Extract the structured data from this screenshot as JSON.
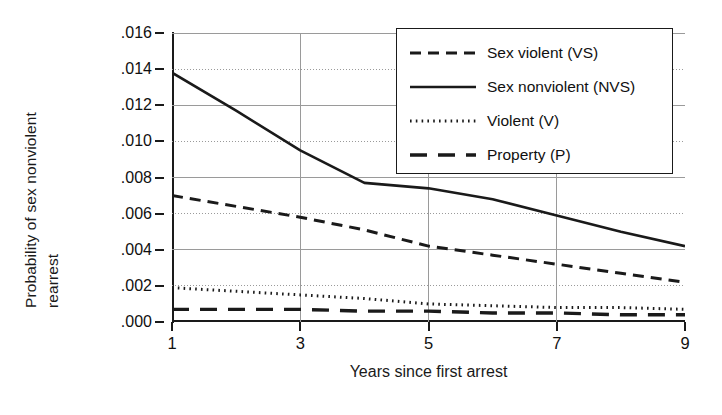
{
  "chart_data": {
    "type": "line",
    "title": "",
    "xlabel": "Years since first arrest",
    "ylabel": "Probability of sex nonviolent rearrest",
    "ylabel_lines": [
      "Probability of sex nonviolent",
      "rearrest"
    ],
    "xlim": [
      1,
      9
    ],
    "ylim": [
      0.0,
      0.016
    ],
    "xticks": [
      1,
      3,
      5,
      7,
      9
    ],
    "xtick_labels": [
      "1",
      "3",
      "5",
      "7",
      "9"
    ],
    "yticks": [
      0.0,
      0.002,
      0.004,
      0.006,
      0.008,
      0.01,
      0.012,
      0.014,
      0.016
    ],
    "ytick_labels": [
      ".000",
      ".002",
      ".004",
      ".006",
      ".008",
      ".010",
      ".012",
      ".014",
      ".016"
    ],
    "grid": true,
    "grid_style": "dotted-horizontal-plus-vertical",
    "legend_position": "top-right",
    "x": [
      1,
      2,
      3,
      4,
      5,
      6,
      7,
      8,
      9
    ],
    "series": [
      {
        "name": "Sex violent (VS)",
        "key": "VS",
        "style": "dashed",
        "color": "#1a1a1a",
        "values": [
          0.007,
          0.0064,
          0.0058,
          0.0051,
          0.0042,
          0.0037,
          0.0032,
          0.0027,
          0.0022
        ]
      },
      {
        "name": "Sex nonviolent (NVS)",
        "key": "NVS",
        "style": "solid",
        "color": "#1a1a1a",
        "values": [
          0.0138,
          0.0117,
          0.0095,
          0.0077,
          0.0074,
          0.0068,
          0.0059,
          0.005,
          0.0042
        ]
      },
      {
        "name": "Violent (V)",
        "key": "V",
        "style": "dotted",
        "color": "#1a1a1a",
        "values": [
          0.0019,
          0.0017,
          0.0015,
          0.0013,
          0.001,
          0.0009,
          0.0008,
          0.0008,
          0.0007
        ]
      },
      {
        "name": "Property (P)",
        "key": "P",
        "style": "longdash",
        "color": "#1a1a1a",
        "values": [
          0.0007,
          0.0007,
          0.0007,
          0.0006,
          0.0006,
          0.0005,
          0.0005,
          0.0004,
          0.0004
        ]
      }
    ]
  },
  "legend": {
    "items": [
      {
        "label": "Sex violent (VS)",
        "style": "dashed"
      },
      {
        "label": "Sex nonviolent (NVS)",
        "style": "solid"
      },
      {
        "label": "Violent (V)",
        "style": "dotted"
      },
      {
        "label": "Property (P)",
        "style": "longdash"
      }
    ]
  },
  "colors": {
    "ink": "#1a1a1a",
    "grid": "#9a9a9a",
    "background": "#ffffff"
  }
}
